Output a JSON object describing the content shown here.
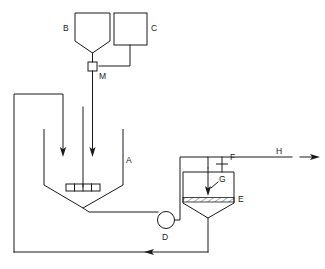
{
  "diagram": {
    "background_color": "#ffffff",
    "line_color": "#1a1a1a",
    "labels": {
      "hopper_b": "B",
      "tank_c": "C",
      "mixer_m": "M",
      "reactor_a": "A",
      "pump_d": "D",
      "vessel_e": "E",
      "valve_f": "F",
      "filter_g": "G",
      "outlet_h": "H"
    },
    "components": [
      {
        "id": "B",
        "name": "hopper-b",
        "type": "hopper",
        "label": "B"
      },
      {
        "id": "C",
        "name": "tank-c",
        "type": "box-tank",
        "label": "C"
      },
      {
        "id": "M",
        "name": "mixer-m",
        "type": "inline-mixer",
        "label": "M"
      },
      {
        "id": "A",
        "name": "reactor-a",
        "type": "stirred-tank",
        "label": "A"
      },
      {
        "id": "D",
        "name": "pump-d",
        "type": "pump",
        "label": "D"
      },
      {
        "id": "E",
        "name": "vessel-e",
        "type": "filter-vessel",
        "label": "E"
      },
      {
        "id": "F",
        "name": "valve-f",
        "type": "valve",
        "label": "F"
      },
      {
        "id": "G",
        "name": "filter-medium-g",
        "type": "filter-medium",
        "label": "G"
      },
      {
        "id": "H",
        "name": "outlet-h",
        "type": "outlet-stream",
        "label": "H"
      }
    ],
    "streams": [
      {
        "name": "hopper-to-mixer",
        "from": "B",
        "to": "M"
      },
      {
        "name": "tank-c-to-mixer",
        "from": "C",
        "to": "M"
      },
      {
        "name": "mixer-to-reactor",
        "from": "M",
        "to": "A"
      },
      {
        "name": "reactor-to-pump",
        "from": "A",
        "to": "D"
      },
      {
        "name": "pump-to-vessel",
        "from": "D",
        "to": "E"
      },
      {
        "name": "vessel-to-recycle",
        "from": "E",
        "to": "A"
      },
      {
        "name": "vessel-to-outlet",
        "from": "E",
        "to": "H"
      }
    ]
  }
}
